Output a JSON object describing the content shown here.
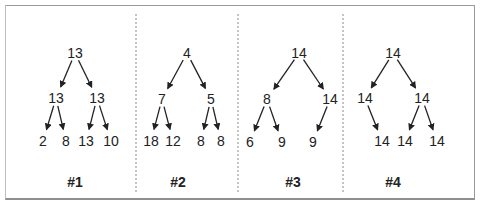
{
  "colors": {
    "frame": "#9a9a9a",
    "separator": "#8a8a8a",
    "ink": "#222222"
  },
  "separators_x": [
    136,
    238,
    343
  ],
  "trees": [
    {
      "label": "#1",
      "label_x": 75,
      "nodes": [
        {
          "id": "r",
          "value": "13",
          "x": 75,
          "y": 53
        },
        {
          "id": "a",
          "value": "13",
          "x": 56,
          "y": 98
        },
        {
          "id": "b",
          "value": "13",
          "x": 97,
          "y": 98
        },
        {
          "id": "a1",
          "value": "2",
          "x": 43,
          "y": 141
        },
        {
          "id": "a2",
          "value": "8",
          "x": 66,
          "y": 141
        },
        {
          "id": "b1",
          "value": "13",
          "x": 86,
          "y": 141
        },
        {
          "id": "b2",
          "value": "10",
          "x": 111,
          "y": 141
        }
      ],
      "edges": [
        [
          "r",
          "a"
        ],
        [
          "r",
          "b"
        ],
        [
          "a",
          "a1"
        ],
        [
          "a",
          "a2"
        ],
        [
          "b",
          "b1"
        ],
        [
          "b",
          "b2"
        ]
      ]
    },
    {
      "label": "#2",
      "label_x": 178,
      "nodes": [
        {
          "id": "r",
          "value": "4",
          "x": 187,
          "y": 53
        },
        {
          "id": "a",
          "value": "7",
          "x": 162,
          "y": 99
        },
        {
          "id": "b",
          "value": "5",
          "x": 211,
          "y": 99
        },
        {
          "id": "a1",
          "value": "18",
          "x": 151,
          "y": 141
        },
        {
          "id": "a2",
          "value": "12",
          "x": 173,
          "y": 141
        },
        {
          "id": "b1",
          "value": "8",
          "x": 201,
          "y": 141
        },
        {
          "id": "b2",
          "value": "8",
          "x": 221,
          "y": 141
        }
      ],
      "edges": [
        [
          "r",
          "a"
        ],
        [
          "r",
          "b"
        ],
        [
          "a",
          "a1"
        ],
        [
          "a",
          "a2"
        ],
        [
          "b",
          "b1"
        ],
        [
          "b",
          "b2"
        ]
      ]
    },
    {
      "label": "#3",
      "label_x": 293,
      "nodes": [
        {
          "id": "r",
          "value": "14",
          "x": 299,
          "y": 53
        },
        {
          "id": "a",
          "value": "8",
          "x": 267,
          "y": 99
        },
        {
          "id": "b",
          "value": "14",
          "x": 330,
          "y": 99
        },
        {
          "id": "a1",
          "value": "6",
          "x": 250,
          "y": 142
        },
        {
          "id": "a2",
          "value": "9",
          "x": 282,
          "y": 142
        },
        {
          "id": "b1",
          "value": "9",
          "x": 313,
          "y": 142
        }
      ],
      "edges": [
        [
          "r",
          "a"
        ],
        [
          "r",
          "b"
        ],
        [
          "a",
          "a1"
        ],
        [
          "a",
          "a2"
        ],
        [
          "b",
          "b1"
        ]
      ]
    },
    {
      "label": "#4",
      "label_x": 393,
      "nodes": [
        {
          "id": "r",
          "value": "14",
          "x": 393,
          "y": 53
        },
        {
          "id": "a",
          "value": "14",
          "x": 365,
          "y": 98
        },
        {
          "id": "b",
          "value": "14",
          "x": 422,
          "y": 98
        },
        {
          "id": "a1",
          "value": "14",
          "x": 382,
          "y": 141
        },
        {
          "id": "b1",
          "value": "14",
          "x": 405,
          "y": 141
        },
        {
          "id": "b2",
          "value": "14",
          "x": 437,
          "y": 141
        }
      ],
      "edges": [
        [
          "r",
          "a"
        ],
        [
          "r",
          "b"
        ],
        [
          "a",
          "a1"
        ],
        [
          "b",
          "b1"
        ],
        [
          "b",
          "b2"
        ]
      ]
    }
  ],
  "label_y": 182
}
